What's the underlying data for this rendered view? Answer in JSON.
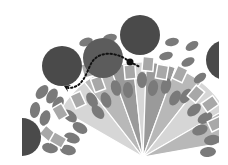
{
  "diagram": {
    "type": "radial-fan-illustration",
    "colors": {
      "background": "#ffffff",
      "big_circle": "#4a4a4a",
      "big_circle_light": "#5c5c5c",
      "oval": "#7a7a7a",
      "rect": "#a8a8a8",
      "rect_border": "#ffffff",
      "fan_dark": "#9a9a9a",
      "fan_mid": "#b8b8b8",
      "fan_light": "#d6d6d6",
      "path": "#111111"
    },
    "clip": {
      "x": 22,
      "y": 15,
      "width": 197,
      "height": 142
    },
    "fan_center": {
      "x": 143,
      "y": 157
    },
    "fan_wedges": [
      {
        "a1": -150,
        "a2": -128,
        "r": 95,
        "shade": "fan_light"
      },
      {
        "a1": -128,
        "a2": -110,
        "r": 95,
        "shade": "fan_mid"
      },
      {
        "a1": -110,
        "a2": -96,
        "r": 95,
        "shade": "fan_dark"
      },
      {
        "a1": -96,
        "a2": -88,
        "r": 95,
        "shade": "fan_light"
      },
      {
        "a1": -88,
        "a2": -70,
        "r": 95,
        "shade": "fan_dark"
      },
      {
        "a1": -70,
        "a2": -52,
        "r": 95,
        "shade": "fan_mid"
      },
      {
        "a1": -52,
        "a2": -30,
        "r": 95,
        "shade": "fan_light"
      },
      {
        "a1": -30,
        "a2": -10,
        "r": 95,
        "shade": "fan_mid"
      }
    ],
    "big_circles": [
      {
        "name": "circle-left",
        "cx": 62,
        "cy": 66,
        "r": 20,
        "shade": "big_circle"
      },
      {
        "name": "circle-middle",
        "cx": 103,
        "cy": 58,
        "r": 20,
        "shade": "big_circle_light"
      },
      {
        "name": "circle-top",
        "cx": 140,
        "cy": 35,
        "r": 20,
        "shade": "big_circle"
      },
      {
        "name": "circle-right",
        "cx": 226,
        "cy": 60,
        "r": 20,
        "shade": "big_circle"
      },
      {
        "name": "circle-bottom-left",
        "cx": 22,
        "cy": 137,
        "r": 19,
        "shade": "big_circle"
      }
    ],
    "ovals": [
      {
        "cx": 42,
        "cy": 92,
        "rx": 5,
        "ry": 8,
        "rot": 40
      },
      {
        "cx": 52,
        "cy": 96,
        "rx": 5,
        "ry": 8,
        "rot": 30
      },
      {
        "cx": 35,
        "cy": 110,
        "rx": 5,
        "ry": 8,
        "rot": 10
      },
      {
        "cx": 45,
        "cy": 118,
        "rx": 5,
        "ry": 8,
        "rot": 20
      },
      {
        "cx": 58,
        "cy": 104,
        "rx": 5,
        "ry": 8,
        "rot": 30
      },
      {
        "cx": 70,
        "cy": 116,
        "rx": 5,
        "ry": 8,
        "rot": -50
      },
      {
        "cx": 80,
        "cy": 128,
        "rx": 5,
        "ry": 8,
        "rot": -60
      },
      {
        "cx": 72,
        "cy": 138,
        "rx": 5,
        "ry": 8,
        "rot": -70
      },
      {
        "cx": 68,
        "cy": 150,
        "rx": 5,
        "ry": 8,
        "rot": -80
      },
      {
        "cx": 50,
        "cy": 148,
        "rx": 5,
        "ry": 8,
        "rot": -80
      },
      {
        "cx": 92,
        "cy": 100,
        "rx": 5,
        "ry": 8,
        "rot": -30
      },
      {
        "cx": 98,
        "cy": 112,
        "rx": 5,
        "ry": 8,
        "rot": -40
      },
      {
        "cx": 106,
        "cy": 100,
        "rx": 5,
        "ry": 8,
        "rot": -20
      },
      {
        "cx": 116,
        "cy": 88,
        "rx": 5,
        "ry": 8,
        "rot": -15
      },
      {
        "cx": 128,
        "cy": 90,
        "rx": 5,
        "ry": 8,
        "rot": -5
      },
      {
        "cx": 142,
        "cy": 80,
        "rx": 5,
        "ry": 8,
        "rot": 0
      },
      {
        "cx": 153,
        "cy": 88,
        "rx": 5,
        "ry": 8,
        "rot": 10
      },
      {
        "cx": 166,
        "cy": 86,
        "rx": 5,
        "ry": 8,
        "rot": 15
      },
      {
        "cx": 175,
        "cy": 98,
        "rx": 5,
        "ry": 8,
        "rot": 30
      },
      {
        "cx": 186,
        "cy": 96,
        "rx": 5,
        "ry": 8,
        "rot": 35
      },
      {
        "cx": 194,
        "cy": 110,
        "rx": 5,
        "ry": 8,
        "rot": 50
      },
      {
        "cx": 205,
        "cy": 118,
        "rx": 5,
        "ry": 8,
        "rot": 60
      },
      {
        "cx": 200,
        "cy": 130,
        "rx": 5,
        "ry": 8,
        "rot": 70
      },
      {
        "cx": 212,
        "cy": 140,
        "rx": 5,
        "ry": 8,
        "rot": 80
      },
      {
        "cx": 208,
        "cy": 152,
        "rx": 5,
        "ry": 8,
        "rot": 85
      },
      {
        "cx": 172,
        "cy": 42,
        "rx": 4,
        "ry": 7,
        "rot": 80
      },
      {
        "cx": 192,
        "cy": 46,
        "rx": 4,
        "ry": 7,
        "rot": 60
      },
      {
        "cx": 166,
        "cy": 56,
        "rx": 4,
        "ry": 7,
        "rot": 75
      },
      {
        "cx": 188,
        "cy": 62,
        "rx": 4,
        "ry": 7,
        "rot": 65
      },
      {
        "cx": 200,
        "cy": 78,
        "rx": 4,
        "ry": 7,
        "rot": 55
      },
      {
        "cx": 110,
        "cy": 38,
        "rx": 4,
        "ry": 7,
        "rot": 80
      },
      {
        "cx": 86,
        "cy": 42,
        "rx": 4,
        "ry": 7,
        "rot": 70
      }
    ],
    "rects": [
      {
        "cx": 60,
        "cy": 112,
        "w": 11,
        "h": 14,
        "rot": -30
      },
      {
        "cx": 78,
        "cy": 100,
        "w": 11,
        "h": 14,
        "rot": -25
      },
      {
        "cx": 48,
        "cy": 134,
        "w": 11,
        "h": 14,
        "rot": -50
      },
      {
        "cx": 58,
        "cy": 140,
        "w": 11,
        "h": 14,
        "rot": -60
      },
      {
        "cx": 98,
        "cy": 84,
        "w": 11,
        "h": 14,
        "rot": -20
      },
      {
        "cx": 130,
        "cy": 72,
        "w": 11,
        "h": 14,
        "rot": -5
      },
      {
        "cx": 148,
        "cy": 64,
        "w": 11,
        "h": 14,
        "rot": 5
      },
      {
        "cx": 162,
        "cy": 72,
        "w": 11,
        "h": 14,
        "rot": 10
      },
      {
        "cx": 180,
        "cy": 74,
        "w": 11,
        "h": 14,
        "rot": 25
      },
      {
        "cx": 196,
        "cy": 94,
        "w": 11,
        "h": 14,
        "rot": 40
      },
      {
        "cx": 210,
        "cy": 104,
        "w": 11,
        "h": 14,
        "rot": 55
      },
      {
        "cx": 216,
        "cy": 124,
        "w": 11,
        "h": 14,
        "rot": 65
      },
      {
        "cx": 88,
        "cy": 70,
        "w": 11,
        "h": 14,
        "rot": -15
      }
    ],
    "path": {
      "d": "M 130 62 C 118 52, 100 50, 92 62 C 86 72, 84 88, 68 88",
      "tail_d": "M 130 62 L 140 67",
      "dot": {
        "cx": 130,
        "cy": 62,
        "r": 3.5
      },
      "arrow_tip": {
        "x": 64,
        "y": 86
      }
    }
  }
}
